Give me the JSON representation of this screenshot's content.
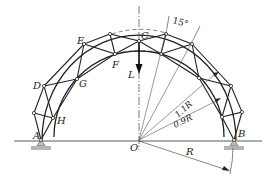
{
  "diagram": {
    "type": "truss-arch",
    "center_label": "O",
    "node_labels": {
      "A": "A",
      "B": "B",
      "C": "C",
      "D": "D",
      "E": "E",
      "F": "F",
      "G": "G",
      "H": "H"
    },
    "load_label": "L",
    "angle_label": "15°",
    "outer_radius_label": "1.1R",
    "inner_radius_label": "0.9R",
    "radius_label": "R",
    "colors": {
      "line": "#2a2a2a",
      "support": "#9a9a9a",
      "background": "#ffffff"
    }
  }
}
